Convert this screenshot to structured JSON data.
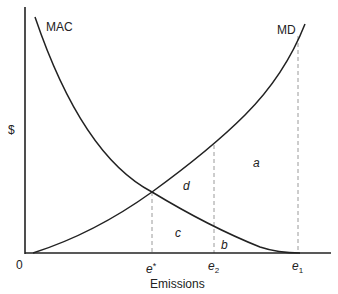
{
  "diagram": {
    "title": "",
    "axes": {
      "y_label": "$",
      "x_label": "Emissions",
      "origin_label": "0"
    },
    "curves": [
      {
        "id": "mac",
        "label": "MAC",
        "description": "Marginal abatement cost, downward sloping convex, reaching zero at e1"
      },
      {
        "id": "md",
        "label": "MD",
        "description": "Marginal damages, upward sloping convex, starting at origin"
      }
    ],
    "x_ticks": [
      {
        "id": "e_star",
        "base": "e",
        "mark": "*",
        "mark_type": "sup"
      },
      {
        "id": "e2",
        "base": "e",
        "mark": "2",
        "mark_type": "sub"
      },
      {
        "id": "e1",
        "base": "e",
        "mark": "1",
        "mark_type": "sub"
      }
    ],
    "regions": [
      {
        "id": "a",
        "label": "a"
      },
      {
        "id": "b",
        "label": "b"
      },
      {
        "id": "c",
        "label": "c"
      },
      {
        "id": "d",
        "label": "d"
      }
    ],
    "colors": {
      "line": "#222222",
      "dashed": "#9a9a9a",
      "background": "#ffffff"
    }
  }
}
